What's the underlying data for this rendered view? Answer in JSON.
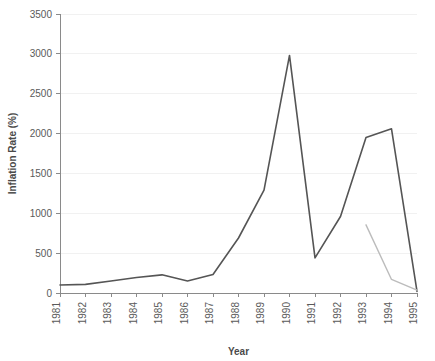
{
  "chart_data": {
    "type": "line",
    "title": "",
    "xlabel": "Year",
    "ylabel": "Inflation Rate (%)",
    "x": [
      1981,
      1982,
      1983,
      1984,
      1985,
      1986,
      1987,
      1988,
      1989,
      1990,
      1991,
      1992,
      1993,
      1994,
      1995
    ],
    "categories": [
      "1981",
      "1982",
      "1983",
      "1984",
      "1985",
      "1986",
      "1987",
      "1988",
      "1989",
      "1990",
      "1991",
      "1992",
      "1993",
      "1994",
      "1995"
    ],
    "xtick_labels": [
      "1981",
      "1982",
      "1983",
      "1984",
      "1985",
      "1986",
      "1987",
      "1988",
      "1989",
      "1990",
      "1991",
      "1992",
      "1993",
      "1994",
      "1995"
    ],
    "ytick_labels": [
      "0",
      "500",
      "1000",
      "1500",
      "2000",
      "2500",
      "3000",
      "3500"
    ],
    "yticks": [
      0,
      500,
      1000,
      1500,
      2000,
      2500,
      3000,
      3500
    ],
    "ylim": [
      0,
      3500
    ],
    "xlim": [
      1981,
      1995
    ],
    "grid": true,
    "legend": "none",
    "series": [
      {
        "name": "series-dark",
        "color": "#555555",
        "width": 1.6,
        "x": [
          1981,
          1982,
          1983,
          1984,
          1985,
          1986,
          1987,
          1988,
          1989,
          1990,
          1991,
          1992,
          1993,
          1994,
          1995
        ],
        "values": [
          100,
          108,
          150,
          195,
          228,
          150,
          232,
          690,
          1290,
          2980,
          440,
          960,
          1950,
          2060,
          20
        ]
      },
      {
        "name": "series-light",
        "color": "#bcbcbc",
        "width": 1.4,
        "x": [
          1993,
          1994,
          1995
        ],
        "values": [
          855,
          170,
          35
        ]
      }
    ]
  },
  "plot": {
    "margin_left": 60,
    "margin_right": 18,
    "margin_top": 14,
    "margin_bottom": 68,
    "width": 435,
    "height": 361
  }
}
